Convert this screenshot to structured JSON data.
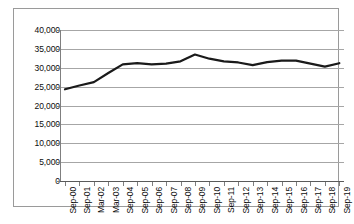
{
  "chart_data": {
    "type": "line",
    "title": "",
    "subtitle": "",
    "xlabel": "",
    "ylabel": "",
    "ylim": [
      0,
      40000
    ],
    "ytick_step": 5000,
    "grid": true,
    "legend": false,
    "line_color": "#1a1a1a",
    "line_width": 2.2,
    "background": "#ffffff",
    "gridline_color": "#a6a6a6",
    "border_color": "#9a9a9a",
    "ytick_labels": [
      "40,000",
      "35,000",
      "30,000",
      "25,000",
      "20,000",
      "15,000",
      "10,000",
      "5,000",
      "0"
    ],
    "ytick_values": [
      40000,
      35000,
      30000,
      25000,
      20000,
      15000,
      10000,
      5000,
      0
    ],
    "categories": [
      "Sep-00",
      "Sep-01",
      "Mar-02",
      "Mar-03",
      "Sep-04",
      "Sep-05",
      "Sep-06",
      "Sep-07",
      "Sep-08",
      "Sep-09",
      "Sep-10",
      "Sep-11",
      "Sep-12",
      "Sep-13",
      "Sep-14",
      "Sep-15",
      "Sep-16",
      "Sep-17",
      "Sep-18",
      "Sep-19"
    ],
    "values": [
      24300,
      25300,
      26200,
      28600,
      30900,
      31200,
      30900,
      31100,
      31700,
      33500,
      32400,
      31700,
      31400,
      30700,
      31500,
      31900,
      31900,
      31100,
      30300,
      31200
    ]
  }
}
